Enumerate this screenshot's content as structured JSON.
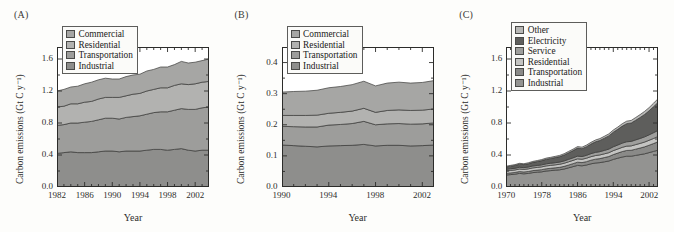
{
  "figure": {
    "panels": [
      {
        "label": "(A)",
        "ylabel": "Carbon emissions (Gt C y⁻¹)",
        "xlabel": "Year",
        "chart_data": {
          "type": "area",
          "title": "(A)",
          "xlabel": "Year",
          "ylabel": "Carbon emissions (Gt C y⁻¹)",
          "xlim": [
            1982,
            2004
          ],
          "ylim": [
            0.0,
            1.75
          ],
          "xticks": [
            1982,
            1986,
            1990,
            1994,
            1998,
            2002
          ],
          "yticks": [
            0.0,
            0.4,
            0.8,
            1.2,
            1.6
          ],
          "ytick_labels": [
            "0.0",
            "0.4",
            "0.8",
            "1.2",
            "1.6"
          ],
          "xtick_labels": [
            "1982",
            "1986",
            "1990",
            "1994",
            "1998",
            "2002"
          ],
          "minor_tick_interval": 1,
          "grid": false,
          "legend_position": "upper-left",
          "stacked": true,
          "x": [
            1982,
            1983,
            1984,
            1985,
            1986,
            1987,
            1988,
            1989,
            1990,
            1991,
            1992,
            1993,
            1994,
            1995,
            1996,
            1997,
            1998,
            1999,
            2000,
            2001,
            2002,
            2003,
            2004
          ],
          "series": [
            {
              "name": "Industrial",
              "color": "#8e8e8c",
              "values": [
                0.42,
                0.43,
                0.44,
                0.43,
                0.43,
                0.43,
                0.44,
                0.45,
                0.45,
                0.44,
                0.45,
                0.45,
                0.45,
                0.46,
                0.47,
                0.47,
                0.46,
                0.47,
                0.48,
                0.46,
                0.45,
                0.46,
                0.46
              ]
            },
            {
              "name": "Transportation",
              "color": "#9d9d9b",
              "values": [
                0.35,
                0.35,
                0.36,
                0.37,
                0.38,
                0.39,
                0.4,
                0.41,
                0.41,
                0.41,
                0.42,
                0.43,
                0.44,
                0.45,
                0.46,
                0.47,
                0.48,
                0.49,
                0.5,
                0.51,
                0.52,
                0.53,
                0.54
              ]
            },
            {
              "name": "Residential",
              "color": "#b2b2b0",
              "values": [
                0.23,
                0.23,
                0.24,
                0.24,
                0.25,
                0.25,
                0.26,
                0.26,
                0.26,
                0.27,
                0.27,
                0.28,
                0.28,
                0.29,
                0.29,
                0.3,
                0.3,
                0.31,
                0.31,
                0.31,
                0.32,
                0.32,
                0.32
              ]
            },
            {
              "name": "Commercial",
              "color": "#a6a6a4",
              "values": [
                0.2,
                0.21,
                0.21,
                0.22,
                0.23,
                0.24,
                0.24,
                0.24,
                0.23,
                0.23,
                0.24,
                0.24,
                0.24,
                0.25,
                0.25,
                0.26,
                0.26,
                0.26,
                0.28,
                0.27,
                0.27,
                0.27,
                0.28
              ]
            }
          ]
        },
        "legend": [
          {
            "label": "Commercial",
            "color": "#a6a6a4"
          },
          {
            "label": "Residential",
            "color": "#b2b2b0"
          },
          {
            "label": "Transportation",
            "color": "#9d9d9b"
          },
          {
            "label": "Industrial",
            "color": "#8e8e8c"
          }
        ]
      },
      {
        "label": "(B)",
        "ylabel": "Carbon emissions (Gt C y⁻¹)",
        "xlabel": "Year",
        "chart_data": {
          "type": "area",
          "title": "(B)",
          "xlabel": "Year",
          "ylabel": "Carbon emissions (Gt C y⁻¹)",
          "xlim": [
            1990,
            2003
          ],
          "ylim": [
            0.0,
            0.45
          ],
          "xticks": [
            1990,
            1994,
            1998,
            2002
          ],
          "yticks": [
            0.0,
            0.1,
            0.2,
            0.3,
            0.4
          ],
          "ytick_labels": [
            "0.0",
            "0.1",
            "0.2",
            "0.3",
            "0.4"
          ],
          "xtick_labels": [
            "1990",
            "1994",
            "1998",
            "2002"
          ],
          "minor_tick_interval": 1,
          "grid": false,
          "legend_position": "upper-left",
          "stacked": true,
          "x": [
            1990,
            1991,
            1992,
            1993,
            1994,
            1995,
            1996,
            1997,
            1998,
            1999,
            2000,
            2001,
            2002,
            2003
          ],
          "series": [
            {
              "name": "Industrial",
              "color": "#8e8e8c",
              "values": [
                0.135,
                0.133,
                0.131,
                0.129,
                0.132,
                0.133,
                0.134,
                0.137,
                0.132,
                0.134,
                0.134,
                0.132,
                0.133,
                0.135
              ]
            },
            {
              "name": "Transportation",
              "color": "#9d9d9b",
              "values": [
                0.06,
                0.061,
                0.062,
                0.064,
                0.067,
                0.068,
                0.07,
                0.074,
                0.068,
                0.069,
                0.07,
                0.07,
                0.07,
                0.071
              ]
            },
            {
              "name": "Residential",
              "color": "#b2b2b0",
              "values": [
                0.035,
                0.036,
                0.037,
                0.038,
                0.038,
                0.039,
                0.04,
                0.042,
                0.04,
                0.043,
                0.044,
                0.044,
                0.044,
                0.045
              ]
            },
            {
              "name": "Commercial",
              "color": "#a6a6a4",
              "values": [
                0.075,
                0.077,
                0.078,
                0.08,
                0.082,
                0.083,
                0.085,
                0.087,
                0.085,
                0.088,
                0.089,
                0.088,
                0.089,
                0.091
              ]
            }
          ]
        },
        "legend": [
          {
            "label": "Commercial",
            "color": "#a6a6a4"
          },
          {
            "label": "Residential",
            "color": "#b2b2b0"
          },
          {
            "label": "Transportation",
            "color": "#9d9d9b"
          },
          {
            "label": "Industrial",
            "color": "#8e8e8c"
          }
        ]
      },
      {
        "label": "(C)",
        "ylabel": "Carbon emissions (Gt C y⁻¹)",
        "xlabel": "Year",
        "chart_data": {
          "type": "area",
          "title": "(C)",
          "xlabel": "Year",
          "ylabel": "Carbon emissions (Gt C y⁻¹)",
          "xlim": [
            1970,
            2004
          ],
          "ylim": [
            0.0,
            1.75
          ],
          "xticks": [
            1970,
            1978,
            1986,
            1994,
            2002
          ],
          "yticks": [
            0.0,
            0.4,
            0.8,
            1.2,
            1.6
          ],
          "ytick_labels": [
            "0.0",
            "0.4",
            "0.8",
            "1.2",
            "1.6"
          ],
          "xtick_labels": [
            "1970",
            "1978",
            "1986",
            "1994",
            "2002"
          ],
          "minor_tick_interval": 1,
          "grid": false,
          "legend_position": "upper-left",
          "stacked": true,
          "x": [
            1970,
            1971,
            1972,
            1973,
            1974,
            1975,
            1976,
            1977,
            1978,
            1979,
            1980,
            1981,
            1982,
            1983,
            1984,
            1985,
            1986,
            1987,
            1988,
            1989,
            1990,
            1991,
            1992,
            1993,
            1994,
            1995,
            1996,
            1997,
            1998,
            1999,
            2000,
            2001,
            2002,
            2003,
            2004
          ],
          "series": [
            {
              "name": "Industrial",
              "color": "#939391",
              "values": [
                0.15,
                0.155,
                0.16,
                0.17,
                0.165,
                0.17,
                0.18,
                0.185,
                0.19,
                0.2,
                0.205,
                0.21,
                0.215,
                0.225,
                0.24,
                0.255,
                0.27,
                0.265,
                0.275,
                0.29,
                0.3,
                0.305,
                0.315,
                0.325,
                0.345,
                0.36,
                0.375,
                0.385,
                0.385,
                0.395,
                0.405,
                0.415,
                0.43,
                0.445,
                0.46
              ]
            },
            {
              "name": "Transportation",
              "color": "#8a8a88",
              "values": [
                0.02,
                0.021,
                0.022,
                0.023,
                0.023,
                0.024,
                0.025,
                0.026,
                0.027,
                0.028,
                0.029,
                0.03,
                0.031,
                0.033,
                0.035,
                0.037,
                0.04,
                0.04,
                0.042,
                0.045,
                0.048,
                0.05,
                0.053,
                0.056,
                0.06,
                0.064,
                0.068,
                0.072,
                0.074,
                0.078,
                0.082,
                0.087,
                0.092,
                0.098,
                0.105
              ]
            },
            {
              "name": "Residential",
              "color": "#c4c4c2",
              "values": [
                0.03,
                0.031,
                0.031,
                0.032,
                0.032,
                0.033,
                0.034,
                0.034,
                0.035,
                0.036,
                0.036,
                0.037,
                0.038,
                0.039,
                0.04,
                0.041,
                0.042,
                0.042,
                0.043,
                0.044,
                0.045,
                0.046,
                0.047,
                0.048,
                0.05,
                0.051,
                0.053,
                0.054,
                0.055,
                0.057,
                0.058,
                0.06,
                0.062,
                0.064,
                0.066
              ]
            },
            {
              "name": "Service",
              "color": "#9e9e9c",
              "values": [
                0.02,
                0.021,
                0.021,
                0.022,
                0.022,
                0.023,
                0.024,
                0.024,
                0.025,
                0.026,
                0.027,
                0.027,
                0.028,
                0.029,
                0.031,
                0.032,
                0.034,
                0.034,
                0.036,
                0.038,
                0.04,
                0.041,
                0.043,
                0.045,
                0.048,
                0.05,
                0.053,
                0.055,
                0.056,
                0.059,
                0.062,
                0.065,
                0.068,
                0.072,
                0.076
              ]
            },
            {
              "name": "Electricity",
              "color": "#5e5e5c",
              "values": [
                0.03,
                0.032,
                0.035,
                0.038,
                0.038,
                0.041,
                0.045,
                0.049,
                0.053,
                0.057,
                0.06,
                0.064,
                0.068,
                0.074,
                0.082,
                0.09,
                0.1,
                0.098,
                0.108,
                0.12,
                0.132,
                0.14,
                0.152,
                0.165,
                0.182,
                0.196,
                0.212,
                0.226,
                0.23,
                0.245,
                0.262,
                0.28,
                0.3,
                0.325,
                0.35
              ]
            },
            {
              "name": "Other",
              "color": "#b8b8b6",
              "values": [
                0.01,
                0.01,
                0.011,
                0.011,
                0.011,
                0.012,
                0.012,
                0.013,
                0.013,
                0.014,
                0.014,
                0.015,
                0.015,
                0.016,
                0.017,
                0.018,
                0.019,
                0.019,
                0.02,
                0.021,
                0.022,
                0.023,
                0.024,
                0.025,
                0.027,
                0.028,
                0.03,
                0.031,
                0.032,
                0.034,
                0.036,
                0.038,
                0.04,
                0.043,
                0.046
              ]
            }
          ]
        },
        "legend": [
          {
            "label": "Other",
            "color": "#b8b8b6"
          },
          {
            "label": "Electricity",
            "color": "#5e5e5c"
          },
          {
            "label": "Service",
            "color": "#9e9e9c"
          },
          {
            "label": "Residential",
            "color": "#c4c4c2"
          },
          {
            "label": "Transportation",
            "color": "#8a8a88"
          },
          {
            "label": "Industrial",
            "color": "#939391"
          }
        ]
      }
    ]
  }
}
